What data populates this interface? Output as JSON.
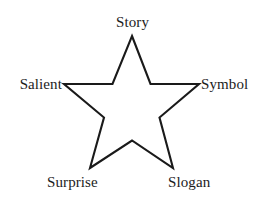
{
  "diagram": {
    "type": "five-point-star",
    "background_color": "#ffffff",
    "stroke_color": "#1a1a1a",
    "stroke_width": 2.1,
    "fill": "none",
    "labels": {
      "top": "Story",
      "right": "Symbol",
      "bottom_right": "Slogan",
      "bottom_left": "Surprise",
      "left": "Salient"
    },
    "label_color": "#1c1c1c",
    "points": [
      {
        "name": "top",
        "label": "Story",
        "x": 132,
        "y": 36
      },
      {
        "name": "right",
        "label": "Symbol",
        "x": 199,
        "y": 84
      },
      {
        "name": "bottom-right",
        "label": "Slogan",
        "x": 173,
        "y": 168
      },
      {
        "name": "bottom-left",
        "label": "Surprise",
        "x": 90,
        "y": 168
      },
      {
        "name": "left",
        "label": "Salient",
        "x": 64,
        "y": 84
      }
    ],
    "star_path": "M 132,36 L 150.5,84 L 199,84 L 159.5,117.5 L 173,168 L 132,140.5 L 90,168 L 104,117.5 L 64,84 L 112.5,84 Z"
  }
}
